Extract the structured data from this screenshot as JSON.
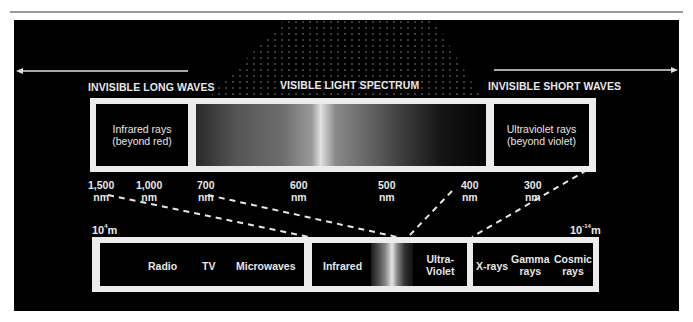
{
  "sections": {
    "long_waves": "INVISIBLE LONG WAVES",
    "visible": "VISIBLE LIGHT SPECTRUM",
    "short_waves": "INVISIBLE SHORT WAVES"
  },
  "upper_band": {
    "left_box": {
      "line1": "Infrared rays",
      "line2": "(beyond red)"
    },
    "right_box": {
      "line1": "Ultraviolet rays",
      "line2": "(beyond violet)"
    }
  },
  "ticks": [
    {
      "value": "1,500",
      "unit": "nm"
    },
    {
      "value": "1,000",
      "unit": "nm"
    },
    {
      "value": "700",
      "unit": "nm"
    },
    {
      "value": "600",
      "unit": "nm"
    },
    {
      "value": "500",
      "unit": "nm"
    },
    {
      "value": "400",
      "unit": "nm"
    },
    {
      "value": "300",
      "unit": "nm"
    }
  ],
  "scale": {
    "left": {
      "base": "10",
      "exponent": "4",
      "unit": "m"
    },
    "right": {
      "base": "10",
      "exponent": "-14",
      "unit": "m"
    }
  },
  "lower_band": {
    "long": [
      "Radio",
      "TV",
      "Microwaves"
    ],
    "infrared": "Infrared",
    "ultraviolet": {
      "line1": "Ultra-",
      "line2": "Violet"
    },
    "short": [
      {
        "line1": "X-rays",
        "line2": ""
      },
      {
        "line1": "Gamma",
        "line2": "rays"
      },
      {
        "line1": "Cosmic",
        "line2": "rays"
      }
    ]
  },
  "colors": {
    "background": "#000000",
    "frame": "#ececec",
    "text": "#e8e8e8",
    "rule": "#9a9a9a"
  }
}
